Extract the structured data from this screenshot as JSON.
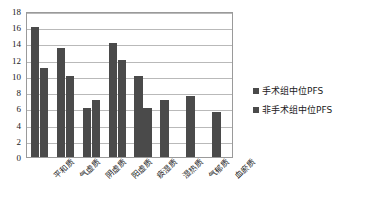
{
  "chart_data": {
    "type": "bar",
    "title": "",
    "subtitle": "",
    "xlabel": "",
    "ylabel": "",
    "ylim": [
      0,
      18
    ],
    "yticks": [
      0,
      2,
      4,
      6,
      8,
      10,
      12,
      14,
      16,
      18
    ],
    "grid": true,
    "legend_position": "right",
    "categories": [
      "平和质",
      "气虚质",
      "阴虚质",
      "阳虚质",
      "痰湿质",
      "湿热质",
      "气郁质",
      "血瘀质"
    ],
    "series": [
      {
        "name": "手术组中位PFS",
        "color": "#4a4a4a",
        "values": [
          16,
          13.5,
          6,
          14,
          10,
          7,
          7.5,
          5.5
        ]
      },
      {
        "name": "非手术组中位PFS",
        "color": "#4a4a4a",
        "values": [
          11,
          10,
          7,
          12,
          6,
          null,
          null,
          null
        ]
      }
    ]
  },
  "legend": {
    "items": [
      {
        "label": "手术组中位PFS",
        "color": "#4a4a4a"
      },
      {
        "label": "非手术组中位PFS",
        "color": "#4a4a4a"
      }
    ]
  },
  "axis": {
    "y_tick_labels": [
      "18",
      "16",
      "14",
      "12",
      "10",
      "8",
      "6",
      "4",
      "2",
      "0"
    ]
  }
}
